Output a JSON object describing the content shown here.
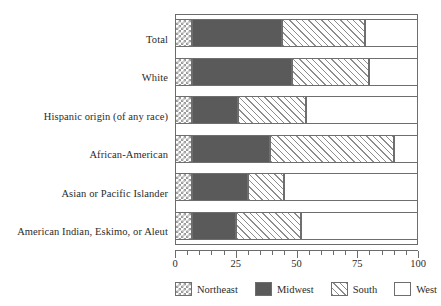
{
  "chart_data": {
    "type": "bar",
    "orientation": "horizontal",
    "stacked": true,
    "title": "",
    "subtitle": "",
    "xlabel": "",
    "ylabel": "",
    "xlim": [
      0,
      100
    ],
    "xticks": [
      0,
      25,
      50,
      75,
      100
    ],
    "xtick_labels": [
      "0",
      "25",
      "50",
      "75",
      "100"
    ],
    "minor_tick_step": 5,
    "grid": false,
    "legend_position": "bottom",
    "categories": [
      "Total",
      "White",
      "Hispanic origin (of any race)",
      "African-American",
      "Asian or Pacific Islander",
      "American Indian, Eskimo, or Aleut"
    ],
    "series": [
      {
        "name": "Northeast",
        "pattern": "checkerboard",
        "color": "#9a9a9a",
        "values": [
          7,
          7,
          7,
          7,
          7,
          7
        ]
      },
      {
        "name": "Midwest",
        "pattern": "solid",
        "color": "#5a5a5a",
        "values": [
          37,
          41,
          19,
          32,
          23,
          18
        ]
      },
      {
        "name": "South",
        "pattern": "diagonal-hatch",
        "color": "#8d8d8d",
        "values": [
          34,
          32,
          28,
          51,
          15,
          27
        ]
      },
      {
        "name": "West",
        "pattern": "empty",
        "color": "#ffffff",
        "values": [
          22,
          20,
          46,
          10,
          55,
          48
        ]
      }
    ],
    "cumulative_boundaries": [
      [
        7,
        44,
        78,
        100
      ],
      [
        7,
        48,
        80,
        100
      ],
      [
        7,
        26,
        54,
        100
      ],
      [
        7,
        39,
        90,
        100
      ],
      [
        7,
        30,
        45,
        100
      ],
      [
        7,
        25,
        52,
        100
      ]
    ]
  },
  "legend": {
    "items": [
      {
        "label": "Northeast"
      },
      {
        "label": "Midwest"
      },
      {
        "label": "South"
      },
      {
        "label": "West"
      }
    ]
  }
}
